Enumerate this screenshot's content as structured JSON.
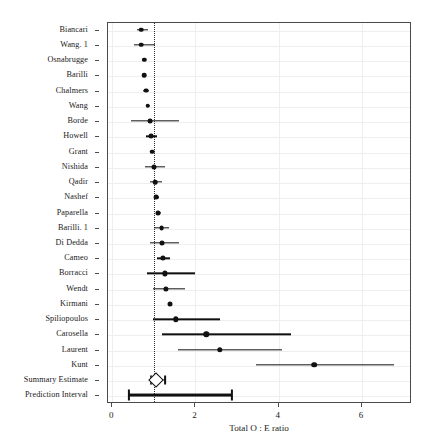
{
  "chart_data": {
    "type": "scatter",
    "subtype": "forest-plot",
    "title": "",
    "xlabel": "Total O : E ratio",
    "ylabel": "",
    "xlim": [
      -0.1,
      7.2
    ],
    "xticks": [
      0,
      2,
      4,
      6
    ],
    "xticklabels": [
      "0",
      "2",
      "4",
      "6"
    ],
    "grid": true,
    "legend": null,
    "reference_line": 1.0,
    "categories": [
      "Biancari",
      "Wang. 1",
      "Osnabrugge",
      "Barilli",
      "Chalmers",
      "Wang",
      "Borde",
      "Howell",
      "Grant",
      "Nishida",
      "Qadir",
      "Nashef",
      "Paparella",
      "Barilli. 1",
      "Di Dedda",
      "Cameo",
      "Borracci",
      "Wendt",
      "Kirmani",
      "Spiliopoulos",
      "Carosella",
      "Laurent",
      "Kunt",
      "Summary Estimate",
      "Prediction Interval"
    ],
    "rows": [
      {
        "label": "Biancari",
        "estimate": 0.72,
        "lower": 0.62,
        "upper": 0.88,
        "marker": "circle",
        "size": 4.6
      },
      {
        "label": "Wang. 1",
        "estimate": 0.72,
        "lower": 0.55,
        "upper": 1.06,
        "marker": "circle",
        "size": 4.6
      },
      {
        "label": "Osnabrugge",
        "estimate": 0.8,
        "lower": 0.77,
        "upper": 0.83,
        "marker": "circle",
        "size": 4.4
      },
      {
        "label": "Barilli",
        "estimate": 0.8,
        "lower": 0.76,
        "upper": 0.84,
        "marker": "circle",
        "size": 4.6
      },
      {
        "label": "Chalmers",
        "estimate": 0.83,
        "lower": 0.77,
        "upper": 0.9,
        "marker": "circle",
        "size": 4.8
      },
      {
        "label": "Wang",
        "estimate": 0.88,
        "lower": 0.83,
        "upper": 0.93,
        "marker": "circle",
        "size": 4.6
      },
      {
        "label": "Borde",
        "estimate": 0.93,
        "lower": 0.47,
        "upper": 1.62,
        "marker": "circle",
        "size": 4.8
      },
      {
        "label": "Howell",
        "estimate": 0.96,
        "lower": 0.83,
        "upper": 1.1,
        "marker": "circle",
        "size": 4.8
      },
      {
        "label": "Grant",
        "estimate": 0.99,
        "lower": 0.96,
        "upper": 1.02,
        "marker": "circle",
        "size": 4.6
      },
      {
        "label": "Nishida",
        "estimate": 1.02,
        "lower": 0.82,
        "upper": 1.29,
        "marker": "circle",
        "size": 5.0
      },
      {
        "label": "Qadir",
        "estimate": 1.06,
        "lower": 0.93,
        "upper": 1.22,
        "marker": "circle",
        "size": 4.6
      },
      {
        "label": "Nashef",
        "estimate": 1.08,
        "lower": 1.02,
        "upper": 1.14,
        "marker": "circle",
        "size": 4.8
      },
      {
        "label": "Paparella",
        "estimate": 1.13,
        "lower": 1.07,
        "upper": 1.19,
        "marker": "circle",
        "size": 5.0
      },
      {
        "label": "Barilli. 1",
        "estimate": 1.21,
        "lower": 1.04,
        "upper": 1.4,
        "marker": "circle",
        "size": 4.8
      },
      {
        "label": "Di Dedda",
        "estimate": 1.22,
        "lower": 0.93,
        "upper": 1.62,
        "marker": "circle",
        "size": 5.0
      },
      {
        "label": "Cameo",
        "estimate": 1.25,
        "lower": 1.09,
        "upper": 1.42,
        "marker": "circle",
        "size": 5.2
      },
      {
        "label": "Borracci",
        "estimate": 1.3,
        "lower": 0.86,
        "upper": 2.02,
        "marker": "circle",
        "size": 5.2
      },
      {
        "label": "Wendt",
        "estimate": 1.32,
        "lower": 1.0,
        "upper": 1.77,
        "marker": "circle",
        "size": 5.2
      },
      {
        "label": "Kirmani",
        "estimate": 1.41,
        "lower": 1.38,
        "upper": 1.45,
        "marker": "circle",
        "size": 5.0
      },
      {
        "label": "Spiliopoulos",
        "estimate": 1.55,
        "lower": 1.0,
        "upper": 2.62,
        "marker": "circle",
        "size": 5.4
      },
      {
        "label": "Carosella",
        "estimate": 2.28,
        "lower": 1.21,
        "upper": 4.32,
        "marker": "circle",
        "size": 5.4
      },
      {
        "label": "Laurent",
        "estimate": 2.61,
        "lower": 1.6,
        "upper": 4.1,
        "marker": "circle",
        "size": 5.4
      },
      {
        "label": "Kunt",
        "estimate": 4.87,
        "lower": 3.48,
        "upper": 6.79,
        "marker": "circle",
        "size": 5.6
      },
      {
        "label": "Summary Estimate",
        "estimate": 1.08,
        "lower": 0.95,
        "upper": 1.3,
        "marker": "diamond",
        "size": 9
      },
      {
        "label": "Prediction Interval",
        "estimate": null,
        "lower": 0.43,
        "upper": 2.9,
        "marker": "bar",
        "size": 0
      }
    ]
  },
  "axis": {
    "x_title": "Total O : E ratio"
  }
}
